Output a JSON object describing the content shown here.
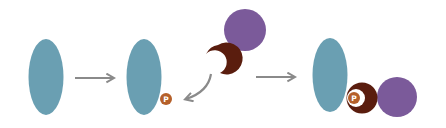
{
  "diagram": {
    "phosphate_label": "P",
    "colors": {
      "protein": "#6a9fb2",
      "phosphate": "#b5602a",
      "reader_domain": "#5a1d0e",
      "partner": "#7b5a9a",
      "arrow": "#8a8a8a",
      "background": "#ffffff"
    },
    "stages": [
      {
        "name": "unmodified-protein"
      },
      {
        "name": "phosphorylated-protein"
      },
      {
        "name": "bound-complex"
      }
    ]
  }
}
